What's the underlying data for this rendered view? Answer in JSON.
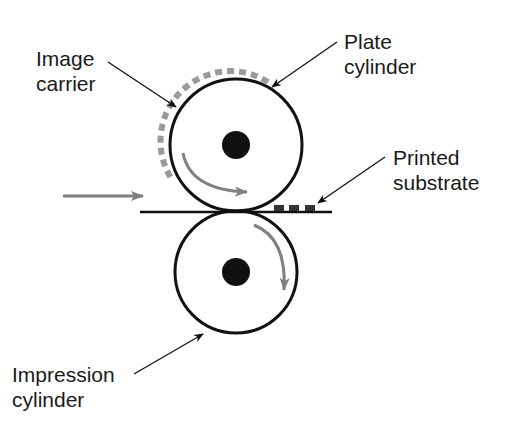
{
  "diagram": {
    "labels": {
      "image_carrier": {
        "line1": "Image",
        "line2": "carrier"
      },
      "plate_cylinder": {
        "line1": "Plate",
        "line2": "cylinder"
      },
      "printed_substrate": {
        "line1": "Printed",
        "line2": "substrate"
      },
      "impression_cylinder": {
        "line1": "Impression",
        "line2": "cylinder"
      }
    },
    "colors": {
      "outline": "#111111",
      "flow_arrow": "#808080",
      "image_carrier": "#9a9a9a",
      "printed_ink": "#333333",
      "background": "#ffffff"
    }
  }
}
